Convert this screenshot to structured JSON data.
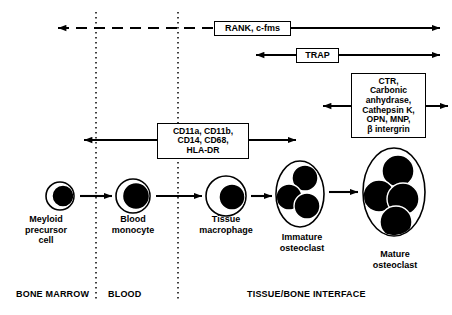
{
  "figure": {
    "width": 452,
    "height": 315,
    "background": "#ffffff",
    "ink": "#000000"
  },
  "marker_boxes": [
    {
      "id": "rank",
      "text": "RANK, c-fms",
      "arrow": {
        "y": 28,
        "left_end": 58,
        "right_end": 440,
        "left_head": true,
        "right_head": true,
        "left_segment_style": "dashed",
        "right_segment_style": "solid"
      }
    },
    {
      "id": "trap",
      "text": "TRAP",
      "arrow": {
        "y": 55,
        "left_end": 256,
        "right_end": 440,
        "left_head": true,
        "right_head": true,
        "left_segment_style": "solid",
        "right_segment_style": "solid"
      }
    },
    {
      "id": "ctr",
      "text": "CTR,\nCarbonic\nanhydrase,\nCathepsin K,\nOPN, MNP,\nβ intergrin",
      "arrow": {
        "y": 106,
        "left_end": 323,
        "right_end": 448,
        "left_head": true,
        "right_head": true,
        "left_segment_style": "solid",
        "right_segment_style": "solid"
      }
    },
    {
      "id": "cd",
      "text": "CD11a, CD11b,\nCD14, CD68,\nHLA-DR",
      "arrow": {
        "y": 140,
        "left_end": 84,
        "right_end": 296,
        "left_head": true,
        "right_head": true,
        "left_segment_style": "solid",
        "right_segment_style": "solid"
      }
    }
  ],
  "compartment_dividers": [
    {
      "id": "marrow-blood",
      "x": 96,
      "y_top": 12,
      "y_bottom": 302,
      "style": "dotted"
    },
    {
      "id": "blood-tissue",
      "x": 178,
      "y_top": 12,
      "y_bottom": 302,
      "style": "dotted"
    }
  ],
  "cells": [
    {
      "id": "myeloid-precursor",
      "label": "Meyloid\nprecursor\ncell",
      "cx": 60,
      "cy": 196,
      "rx": 14,
      "ry": 14,
      "nuclei": [
        {
          "cx": 63,
          "cy": 196,
          "r": 11
        }
      ]
    },
    {
      "id": "blood-monocyte",
      "label": "Blood\nmonocyte",
      "cx": 133,
      "cy": 196,
      "rx": 17,
      "ry": 17,
      "nuclei": [
        {
          "cx": 136,
          "cy": 196,
          "r": 13.5
        }
      ]
    },
    {
      "id": "tissue-macrophage",
      "label": "Tissue\nmacrophage",
      "cx": 226,
      "cy": 196,
      "rx": 20,
      "ry": 20,
      "nuclei": [
        {
          "cx": 232,
          "cy": 197,
          "r": 13
        }
      ]
    },
    {
      "id": "immature-osteoclast",
      "label": "Immature\nosteoclast",
      "cx": 300,
      "cy": 194,
      "rx": 24,
      "ry": 33,
      "nuclei": [
        {
          "cx": 305,
          "cy": 178,
          "r": 13
        },
        {
          "cx": 289,
          "cy": 197,
          "r": 13
        },
        {
          "cx": 307,
          "cy": 206,
          "r": 13
        }
      ]
    },
    {
      "id": "mature-osteoclast",
      "label": "Mature\nosteoclast",
      "cx": 394,
      "cy": 192,
      "rx": 31,
      "ry": 44,
      "nuclei": [
        {
          "cx": 398,
          "cy": 171,
          "r": 16
        },
        {
          "cx": 379,
          "cy": 196,
          "r": 16
        },
        {
          "cx": 403,
          "cy": 199,
          "r": 16
        },
        {
          "cx": 396,
          "cy": 222,
          "r": 16
        }
      ]
    }
  ],
  "cell_arrows": [
    {
      "id": "precursor-to-monocyte",
      "x1": 80,
      "x2": 112,
      "y": 196
    },
    {
      "id": "monocyte-to-macrophage",
      "x1": 156,
      "x2": 202,
      "y": 196
    },
    {
      "id": "macrophage-to-immature",
      "x1": 251,
      "x2": 272,
      "y": 196
    },
    {
      "id": "immature-to-mature",
      "x1": 329,
      "x2": 358,
      "y": 192
    }
  ],
  "zones": [
    {
      "id": "bone-marrow",
      "label": "BONE MARROW"
    },
    {
      "id": "blood",
      "label": "BLOOD"
    },
    {
      "id": "tissue-bone-interface",
      "label": "TISSUE/BONE INTERFACE"
    }
  ]
}
